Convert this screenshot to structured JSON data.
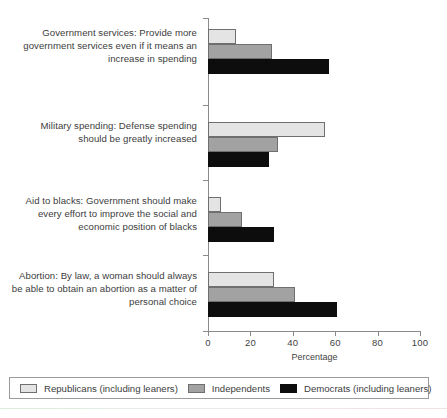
{
  "chart_data": {
    "type": "bar",
    "orientation": "horizontal",
    "title": "",
    "xlabel": "Percentage",
    "ylabel": "",
    "xlim": [
      0,
      100
    ],
    "xticks": [
      "0",
      "20",
      "40",
      "60",
      "80",
      "100"
    ],
    "grid": false,
    "legend_position": "bottom",
    "categories": [
      "Government services: Provide more government services even if it means an increase in spending",
      "Military spending: Defense spending should be greatly increased",
      "Aid to blacks: Government should make every effort to improve the social and economic position of blacks",
      "Abortion: By law, a woman should always be able to obtain an abortion as a matter of personal choice"
    ],
    "category_lines": [
      [
        "Government services: Provide more",
        "government services even if it means an",
        "increase in spending"
      ],
      [
        "Military spending: Defense spending",
        "should be greatly increased"
      ],
      [
        "Aid to blacks: Government should make",
        "every effort to improve the social and",
        "economic position of blacks"
      ],
      [
        "Abortion: By law, a woman should always",
        "be able to obtain an abortion as a matter of",
        "personal choice"
      ]
    ],
    "series": [
      {
        "name": "Republicans (including leaners)",
        "key": "rep",
        "color": "#e4e4e4",
        "values": [
          13,
          55,
          6,
          31
        ]
      },
      {
        "name": "Independents",
        "key": "ind",
        "color": "#a2a2a2",
        "values": [
          30,
          33,
          16,
          41
        ]
      },
      {
        "name": "Democrats (including leaners)",
        "key": "dem",
        "color": "#0d0d0d",
        "values": [
          57,
          29,
          31,
          61
        ]
      }
    ]
  },
  "legend": {
    "items": [
      {
        "label": "Republicans (including leaners)",
        "key": "rep"
      },
      {
        "label": "Independents",
        "key": "ind"
      },
      {
        "label": "Democrats (including leaners)",
        "key": "dem"
      }
    ]
  },
  "axis": {
    "x_title": "Percentage",
    "tick_labels": [
      "0",
      "20",
      "40",
      "60",
      "80",
      "100"
    ]
  }
}
